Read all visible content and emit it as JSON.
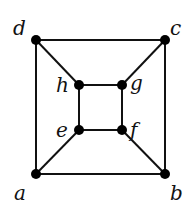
{
  "graph": {
    "nodes": [
      {
        "id": "a",
        "label": "a",
        "x": 36,
        "y": 174,
        "lx": 14,
        "ly": 200
      },
      {
        "id": "b",
        "label": "b",
        "x": 165,
        "y": 174,
        "lx": 170,
        "ly": 200
      },
      {
        "id": "c",
        "label": "c",
        "x": 165,
        "y": 40,
        "lx": 170,
        "ly": 35
      },
      {
        "id": "d",
        "label": "d",
        "x": 36,
        "y": 40,
        "lx": 13,
        "ly": 35
      },
      {
        "id": "e",
        "label": "e",
        "x": 79,
        "y": 130,
        "lx": 56,
        "ly": 137
      },
      {
        "id": "f",
        "label": "f",
        "x": 122,
        "y": 130,
        "lx": 130,
        "ly": 137
      },
      {
        "id": "g",
        "label": "g",
        "x": 122,
        "y": 85,
        "lx": 130,
        "ly": 90
      },
      {
        "id": "h",
        "label": "h",
        "x": 79,
        "y": 85,
        "lx": 56,
        "ly": 92
      }
    ],
    "edges": [
      [
        "a",
        "b"
      ],
      [
        "b",
        "c"
      ],
      [
        "c",
        "d"
      ],
      [
        "d",
        "a"
      ],
      [
        "e",
        "f"
      ],
      [
        "f",
        "g"
      ],
      [
        "g",
        "h"
      ],
      [
        "h",
        "e"
      ],
      [
        "a",
        "e"
      ],
      [
        "b",
        "f"
      ],
      [
        "c",
        "g"
      ],
      [
        "d",
        "h"
      ]
    ]
  }
}
